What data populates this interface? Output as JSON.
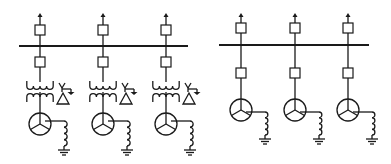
{
  "diagram": {
    "title": "",
    "colors": {
      "line": "#1a1a1a",
      "background": "#ffffff"
    },
    "panels": [
      {
        "id": "left",
        "description": "Unit-connected generators with step-up transformers feeding a common busbar",
        "busbar": {
          "x1": 19,
          "x2": 188,
          "y": 46
        },
        "feeders": [
          {
            "x": 40,
            "components": [
              "outgoing-arrow",
              "circuit-breaker",
              "busbar-tap",
              "circuit-breaker",
              "transformer",
              "generator-star",
              "grounding-reactor",
              "ground"
            ],
            "winding_label": "Δ"
          },
          {
            "x": 103,
            "components": [
              "outgoing-arrow",
              "circuit-breaker",
              "busbar-tap",
              "circuit-breaker",
              "transformer",
              "generator-star",
              "grounding-reactor",
              "ground"
            ],
            "winding_label": "Δ"
          },
          {
            "x": 166,
            "components": [
              "outgoing-arrow",
              "circuit-breaker",
              "busbar-tap",
              "circuit-breaker",
              "transformer",
              "generator-star",
              "grounding-reactor",
              "ground"
            ],
            "winding_label": "Δ"
          }
        ]
      },
      {
        "id": "right",
        "description": "Generators directly connected to a common busbar",
        "busbar": {
          "x1": 219,
          "x2": 369,
          "y": 45
        },
        "feeders": [
          {
            "x": 241,
            "components": [
              "outgoing-arrow",
              "circuit-breaker",
              "busbar-tap",
              "circuit-breaker",
              "generator-star",
              "grounding-reactor",
              "ground"
            ]
          },
          {
            "x": 295,
            "components": [
              "outgoing-arrow",
              "circuit-breaker",
              "busbar-tap",
              "circuit-breaker",
              "generator-star",
              "grounding-reactor",
              "ground"
            ]
          },
          {
            "x": 348,
            "components": [
              "outgoing-arrow",
              "circuit-breaker",
              "busbar-tap",
              "circuit-breaker",
              "generator-star",
              "grounding-reactor",
              "ground"
            ]
          }
        ]
      }
    ]
  }
}
